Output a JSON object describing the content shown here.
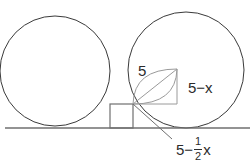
{
  "figure": {
    "type": "geometry-diagram",
    "background_color": "#ffffff",
    "stroke_color": "#3a3a3a",
    "light_stroke_color": "#8a8a8a",
    "text_color": "#2b2b2b"
  },
  "labels": {
    "hypotenuse": "5",
    "vertical_side": "5−x",
    "base": {
      "lead": "5",
      "minus": "−",
      "numerator": "1",
      "denominator": "2",
      "variable": "x"
    }
  },
  "shapes": {
    "ground_line": {
      "x1": 5,
      "y1": 128,
      "x2": 250,
      "y2": 128
    },
    "left_circle": {
      "cx": 55,
      "cy": 71,
      "r": 55
    },
    "right_circle": {
      "cx": 186,
      "cy": 70,
      "r": 58
    },
    "rectangle": {
      "x": 110,
      "y": 104,
      "width": 23,
      "height": 24
    },
    "triangle": {
      "vertex_origin": {
        "x": 133,
        "y": 104
      },
      "vertex_apex": {
        "x": 177,
        "y": 69
      },
      "vertex_corner": {
        "x": 177,
        "y": 104
      }
    },
    "lens": {
      "start": {
        "x": 133,
        "y": 104
      },
      "end": {
        "x": 177,
        "y": 69
      }
    },
    "leader_line": {
      "x1": 133,
      "y1": 104,
      "x2": 172,
      "y2": 139
    }
  }
}
